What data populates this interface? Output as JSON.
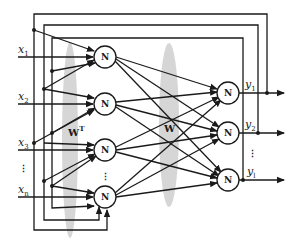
{
  "diagram": {
    "type": "recurrent neural network (two-layer with feedback)",
    "inputs": [
      {
        "label": "x",
        "sub": "1"
      },
      {
        "label": "x",
        "sub": "2"
      },
      {
        "label": "x",
        "sub": "3"
      },
      {
        "label": "x",
        "sub": "n"
      }
    ],
    "input_ellipsis": "⋮",
    "hidden_nodes": [
      "N",
      "N",
      "N",
      "N"
    ],
    "hidden_ellipsis": "⋮",
    "output_nodes": [
      "N",
      "N",
      "N"
    ],
    "outputs": [
      {
        "label": "y",
        "sub": "1"
      },
      {
        "label": "y",
        "sub": "2"
      },
      {
        "label": "y",
        "sub": "l"
      }
    ],
    "output_ellipsis": "⋮",
    "weights": {
      "input_layer": {
        "label": "W",
        "sup": "T"
      },
      "hidden_layer": {
        "label": "W"
      }
    },
    "colors": {
      "line": "#1a1a1a",
      "shade": "#c8c8c8",
      "background": "#ffffff"
    }
  }
}
